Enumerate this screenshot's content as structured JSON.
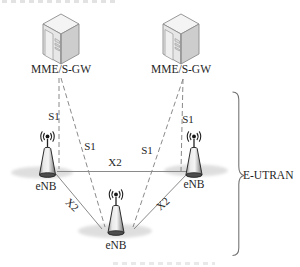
{
  "diagram": {
    "type": "lte-network-architecture",
    "core_network": {
      "mme_left": {
        "label": "MME/S-GW",
        "icon": "server-cabinet-icon"
      },
      "mme_right": {
        "label": "MME/S-GW",
        "icon": "server-cabinet-icon"
      }
    },
    "ran": {
      "enb_left": {
        "label": "eNB",
        "icon": "radio-tower-icon"
      },
      "enb_right": {
        "label": "eNB",
        "icon": "radio-tower-icon"
      },
      "enb_bottom": {
        "label": "eNB",
        "icon": "radio-tower-icon"
      }
    },
    "interfaces": {
      "s1_left_vertical": {
        "label": "S1",
        "style": "dashed",
        "from": "mme_left",
        "to": "enb_left"
      },
      "s1_left_diagonal": {
        "label": "S1",
        "style": "dashed",
        "from": "mme_left",
        "to": "enb_bottom"
      },
      "s1_right_diagonal": {
        "label": "S1",
        "style": "dashed",
        "from": "mme_right",
        "to": "enb_bottom"
      },
      "s1_right_vertical": {
        "label": "S1",
        "style": "dashed",
        "from": "mme_right",
        "to": "enb_right"
      },
      "x2_horizontal": {
        "label": "X2",
        "style": "solid",
        "from": "enb_left",
        "to": "enb_right"
      },
      "x2_left_diagonal": {
        "label": "X2",
        "style": "solid",
        "from": "enb_left",
        "to": "enb_bottom"
      },
      "x2_right_diagonal": {
        "label": "X2",
        "style": "solid",
        "from": "enb_right",
        "to": "enb_bottom"
      }
    },
    "region": {
      "label": "E-UTRAN"
    },
    "colors": {
      "background": "#ffffff",
      "line": "#8a8a8a",
      "text": "#1f1f1f",
      "shadow": "#d7d7d7",
      "brace": "#707070"
    }
  }
}
